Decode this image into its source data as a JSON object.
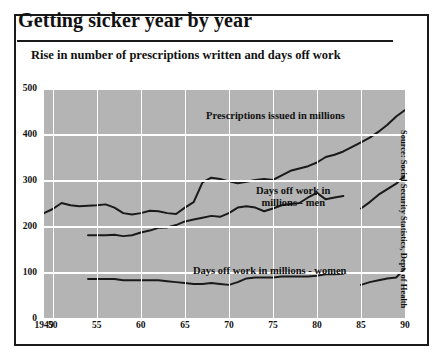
{
  "title": "Getting sicker year by year",
  "subtitle": "Rise in number of prescriptions written and days off work",
  "source": "Source: Social Security Statistics, Dept. of Health",
  "labels": {
    "prescriptions": "Prescriptions issued in millions",
    "men_line1": "Days off work in",
    "men_line2": "millions - men",
    "women": "Days off work in millions - women"
  },
  "colors": {
    "plot_background": "#b4b4b4",
    "gridline": "#ffffff",
    "line": "#1a1a1a",
    "frame": "#1a1a1a",
    "text": "#111111"
  },
  "chart_data": {
    "type": "line",
    "title": "Getting sicker year by year",
    "subtitle": "Rise in number of prescriptions written and days off work",
    "xlabel": "",
    "ylabel": "",
    "xlim": [
      1949,
      1990
    ],
    "ylim": [
      0,
      500
    ],
    "grid": true,
    "legend_position": "inline-annotations",
    "ytick_labels": [
      "0",
      "100",
      "200",
      "300",
      "400",
      "500"
    ],
    "yticks": [
      0,
      100,
      200,
      300,
      400,
      500
    ],
    "xtick_labels": [
      "1949",
      "50",
      "55",
      "60",
      "65",
      "70",
      "75",
      "80",
      "85",
      "90"
    ],
    "xticks": [
      1949,
      1950,
      1955,
      1960,
      1965,
      1970,
      1975,
      1980,
      1985,
      1990
    ],
    "series": [
      {
        "name": "Prescriptions issued in millions",
        "x": [
          1949,
          1950,
          1951,
          1952,
          1953,
          1954,
          1955,
          1956,
          1957,
          1958,
          1959,
          1960,
          1961,
          1962,
          1963,
          1964,
          1965,
          1966,
          1967,
          1968,
          1969,
          1970,
          1971,
          1972,
          1973,
          1974,
          1975,
          1976,
          1977,
          1978,
          1979,
          1980,
          1981,
          1982,
          1983,
          1984,
          1985,
          1986,
          1987,
          1988,
          1989,
          1990
        ],
        "values": [
          228,
          237,
          250,
          245,
          243,
          244,
          245,
          247,
          240,
          228,
          225,
          228,
          233,
          232,
          228,
          226,
          240,
          252,
          295,
          305,
          302,
          297,
          293,
          296,
          300,
          302,
          300,
          310,
          320,
          325,
          330,
          338,
          350,
          355,
          362,
          372,
          382,
          392,
          405,
          420,
          438,
          452
        ]
      },
      {
        "name": "Days off work in millions - men",
        "x": [
          1954,
          1955,
          1956,
          1957,
          1958,
          1959,
          1960,
          1961,
          1962,
          1963,
          1964,
          1965,
          1966,
          1967,
          1968,
          1969,
          1970,
          1971,
          1972,
          1973,
          1974,
          1975,
          1976,
          1977,
          1978,
          1979,
          1980,
          1981,
          1982,
          1983
        ],
        "values": [
          180,
          180,
          180,
          181,
          178,
          180,
          186,
          190,
          196,
          197,
          202,
          210,
          214,
          218,
          222,
          220,
          228,
          240,
          243,
          240,
          232,
          238,
          245,
          248,
          250,
          262,
          272,
          258,
          262,
          265
        ]
      },
      {
        "name": "Days off work in millions - men (continued)",
        "x": [
          1985,
          1986,
          1987,
          1988,
          1989,
          1990
        ],
        "values": [
          238,
          252,
          268,
          280,
          292,
          310
        ]
      },
      {
        "name": "Days off work in millions - women",
        "x": [
          1954,
          1955,
          1956,
          1957,
          1958,
          1959,
          1960,
          1961,
          1962,
          1963,
          1964,
          1965,
          1966,
          1967,
          1968,
          1969,
          1970,
          1971,
          1972,
          1973,
          1974,
          1975,
          1976,
          1977,
          1978,
          1979,
          1980,
          1981,
          1982,
          1983
        ],
        "values": [
          85,
          85,
          85,
          85,
          82,
          82,
          82,
          82,
          82,
          80,
          78,
          76,
          74,
          74,
          76,
          74,
          72,
          78,
          86,
          88,
          88,
          88,
          90,
          90,
          90,
          90,
          92,
          95,
          95,
          96
        ]
      },
      {
        "name": "Days off work in millions - women (continued)",
        "x": [
          1985,
          1986,
          1987,
          1988,
          1989,
          1990
        ],
        "values": [
          72,
          78,
          82,
          86,
          88,
          108
        ]
      }
    ]
  }
}
